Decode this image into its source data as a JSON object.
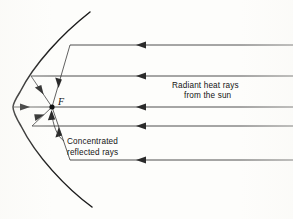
{
  "figure": {
    "type": "optics-ray-diagram",
    "background_color": "#fdfdfb",
    "line_color": "#3a3a3a",
    "mirror_color": "#1c1c1c"
  },
  "labels": {
    "focus": "F",
    "incoming_line1": "Radiant heat rays",
    "incoming_line2": "from the sun",
    "reflected_line1": "Concentrated",
    "reflected_line2": "reflected rays"
  },
  "geometry": {
    "focus_point": {
      "x": 52,
      "y": 107
    },
    "vertex_point": {
      "x": 13,
      "y": 107
    },
    "mirror_top_end": {
      "x": 90,
      "y": 12
    },
    "mirror_bottom_end": {
      "x": 92,
      "y": 207
    },
    "canvas": {
      "width": 293,
      "height": 219
    }
  },
  "incoming_rays": [
    {
      "id": "ray-1",
      "y": 45,
      "x_start": 293,
      "x_end": 70,
      "arrow_x": 142
    },
    {
      "id": "ray-2",
      "y": 76,
      "x_start": 293,
      "x_end": 31,
      "arrow_x": 142
    },
    {
      "id": "ray-3",
      "y": 107,
      "x_start": 293,
      "x_end": 52,
      "arrow_x": 142
    },
    {
      "id": "ray-4",
      "y": 126,
      "x_start": 293,
      "x_end": 32,
      "arrow_x": 142
    },
    {
      "id": "ray-5",
      "y": 160,
      "x_start": 293,
      "x_end": 70,
      "arrow_x": 142
    }
  ],
  "reflected_rays": [
    {
      "id": "refl-1",
      "from_x": 70,
      "from_y": 45,
      "to_x": 52,
      "to_y": 107,
      "arrow_t": 0.62
    },
    {
      "id": "refl-2",
      "from_x": 31,
      "from_y": 76,
      "to_x": 52,
      "to_y": 107,
      "arrow_t": 0.55
    },
    {
      "id": "refl-3",
      "from_x": 13,
      "from_y": 107,
      "to_x": 52,
      "to_y": 107,
      "arrow_t": 0.4
    },
    {
      "id": "refl-4",
      "from_x": 32,
      "from_y": 126,
      "to_x": 52,
      "to_y": 107,
      "arrow_t": 0.55
    },
    {
      "id": "refl-5",
      "from_x": 70,
      "from_y": 160,
      "to_x": 52,
      "to_y": 107,
      "arrow_t": 0.62
    }
  ],
  "text_positions": {
    "incoming_label": {
      "x": 172,
      "y": 88
    },
    "reflected_label": {
      "x": 67,
      "y": 142
    },
    "focus_label": {
      "x": 58,
      "y": 105
    }
  }
}
